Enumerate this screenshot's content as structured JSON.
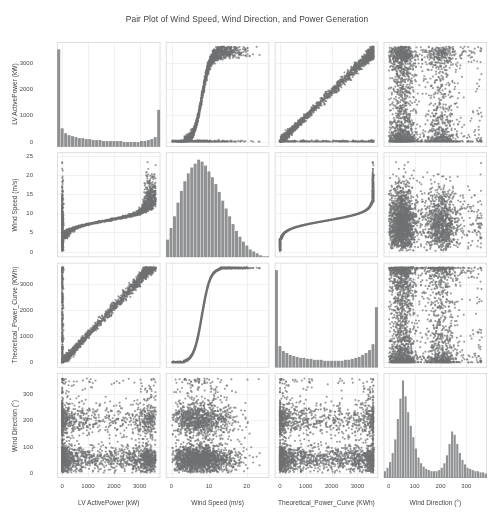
{
  "chart_data": {
    "type": "scatter",
    "title": "Pair Plot of Wind Speed, Wind Direction, and Power Generation",
    "layout": "pairplot-4x4",
    "grid": true,
    "legend": "none",
    "marker_color": "#6f7072",
    "hist_color": "#7d7e80",
    "variables": [
      {
        "key": "power",
        "label": "LV ActivePower (kW)",
        "axis_label": "LV ActivePower (kW)",
        "ticks": [
          0,
          1000,
          2000,
          3000
        ],
        "tick_labels": [
          "0",
          "1000",
          "2000",
          "3000"
        ],
        "range": [
          -200,
          3800
        ],
        "distribution": "zero-inflated-right-tail",
        "hist_bins": 30,
        "hist_values": [
          100,
          19,
          14,
          12,
          11,
          10,
          9,
          9,
          8,
          8,
          7,
          7,
          7,
          6,
          6,
          6,
          6,
          6,
          6,
          5,
          5,
          5,
          5,
          5,
          6,
          6,
          7,
          8,
          10,
          38
        ]
      },
      {
        "key": "wind_speed",
        "label": "Wind Speed (m/s)",
        "axis_label": "Wind Speed (m/s)",
        "ticks": [
          0,
          5,
          10,
          15,
          20,
          25
        ],
        "tick_labels": [
          "0",
          "5",
          "10",
          "15",
          "20",
          "25"
        ],
        "xticks": [
          0,
          10,
          20
        ],
        "xtick_labels": [
          "0",
          "10",
          "20"
        ],
        "range": [
          -1.5,
          26
        ],
        "distribution": "weibull-right-skewed",
        "hist_bins": 30,
        "hist_values": [
          18,
          30,
          42,
          56,
          68,
          78,
          86,
          92,
          96,
          100,
          98,
          94,
          88,
          82,
          75,
          67,
          58,
          50,
          42,
          34,
          27,
          21,
          16,
          12,
          8,
          6,
          4,
          2,
          1,
          1
        ]
      },
      {
        "key": "theoretical_power",
        "label": "Theoretical_Power_Curve (KWh)",
        "axis_label": "Theoretical_Power_Curve (KWh)",
        "ticks": [
          0,
          1000,
          2000,
          3000
        ],
        "tick_labels": [
          "0",
          "1000",
          "2000",
          "3000"
        ],
        "range": [
          -200,
          3800
        ],
        "distribution": "bimodal-edges",
        "hist_bins": 30,
        "hist_values": [
          100,
          22,
          17,
          15,
          13,
          12,
          11,
          10,
          10,
          9,
          9,
          8,
          8,
          8,
          7,
          7,
          7,
          7,
          7,
          7,
          8,
          8,
          9,
          10,
          11,
          13,
          15,
          18,
          24,
          62
        ]
      },
      {
        "key": "wind_direction",
        "label": "Wind Direction (°)",
        "axis_label": "Wind Direction (°)",
        "ticks": [
          0,
          100,
          200,
          300
        ],
        "tick_labels": [
          "0",
          "100",
          "200",
          "300"
        ],
        "range": [
          -20,
          380
        ],
        "distribution": "bimodal",
        "hist_bins": 40,
        "hist_values": [
          6,
          9,
          14,
          22,
          34,
          52,
          70,
          86,
          72,
          58,
          46,
          36,
          26,
          18,
          13,
          10,
          8,
          7,
          6,
          6,
          6,
          7,
          9,
          13,
          20,
          30,
          41,
          38,
          30,
          22,
          16,
          12,
          9,
          8,
          7,
          6,
          6,
          5,
          5,
          4
        ]
      }
    ],
    "panels": [
      {
        "row": 0,
        "col": 0,
        "kind": "hist",
        "var": "power"
      },
      {
        "row": 0,
        "col": 1,
        "kind": "scatter",
        "x": "wind_speed",
        "y": "power",
        "pattern": "power-curve"
      },
      {
        "row": 0,
        "col": 2,
        "kind": "scatter",
        "x": "theoretical_power",
        "y": "power",
        "pattern": "diagonal-band"
      },
      {
        "row": 0,
        "col": 3,
        "kind": "scatter",
        "x": "wind_direction",
        "y": "power",
        "pattern": "direction-cloud"
      },
      {
        "row": 1,
        "col": 0,
        "kind": "scatter",
        "x": "power",
        "y": "wind_speed",
        "pattern": "power-curve-t"
      },
      {
        "row": 1,
        "col": 1,
        "kind": "hist",
        "var": "wind_speed"
      },
      {
        "row": 1,
        "col": 2,
        "kind": "scatter",
        "x": "theoretical_power",
        "y": "wind_speed",
        "pattern": "sigmoid"
      },
      {
        "row": 1,
        "col": 3,
        "kind": "scatter",
        "x": "wind_direction",
        "y": "wind_speed",
        "pattern": "direction-speed"
      },
      {
        "row": 2,
        "col": 0,
        "kind": "scatter",
        "x": "power",
        "y": "theoretical_power",
        "pattern": "diagonal-band-t"
      },
      {
        "row": 2,
        "col": 1,
        "kind": "scatter",
        "x": "wind_speed",
        "y": "theoretical_power",
        "pattern": "sigmoid-t"
      },
      {
        "row": 2,
        "col": 2,
        "kind": "hist",
        "var": "theoretical_power"
      },
      {
        "row": 2,
        "col": 3,
        "kind": "scatter",
        "x": "wind_direction",
        "y": "theoretical_power",
        "pattern": "direction-cloud"
      },
      {
        "row": 3,
        "col": 0,
        "kind": "scatter",
        "x": "power",
        "y": "wind_direction",
        "pattern": "direction-cloud-t"
      },
      {
        "row": 3,
        "col": 1,
        "kind": "scatter",
        "x": "wind_speed",
        "y": "wind_direction",
        "pattern": "direction-speed-t"
      },
      {
        "row": 3,
        "col": 2,
        "kind": "scatter",
        "x": "theoretical_power",
        "y": "wind_direction",
        "pattern": "direction-cloud-t"
      },
      {
        "row": 3,
        "col": 3,
        "kind": "hist",
        "var": "wind_direction"
      }
    ]
  },
  "ticks": {
    "power": [
      "0",
      "1000",
      "2000",
      "3000"
    ],
    "wind_speed_y": [
      "0",
      "5",
      "10",
      "15",
      "20",
      "25"
    ],
    "wind_speed_x": [
      "0",
      "10",
      "20"
    ],
    "theoretical_power": [
      "0",
      "1000",
      "2000",
      "3000"
    ],
    "wind_direction": [
      "0",
      "100",
      "200",
      "300"
    ]
  }
}
